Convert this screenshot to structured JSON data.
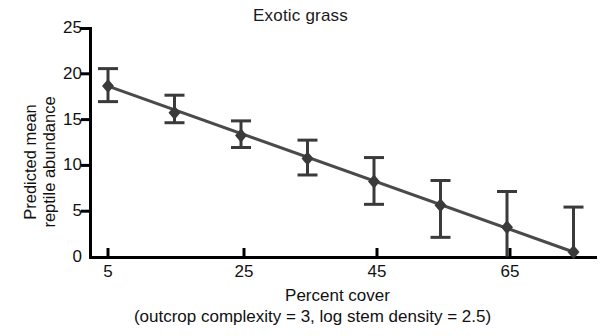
{
  "chart_data": {
    "type": "scatter",
    "title": "Exotic grass",
    "xlabel": "Percent cover",
    "xlabel_note": "(outcrop complexity = 3, log stem density = 2.5)",
    "ylabel": "Predicted mean\nreptile abundance",
    "xlim": [
      0,
      80
    ],
    "ylim": [
      0,
      25
    ],
    "xticks": [
      5,
      25,
      45,
      65
    ],
    "yticks": [
      0,
      5,
      10,
      15,
      20,
      25
    ],
    "xtick_labels": [
      "5",
      "25",
      "45",
      "65"
    ],
    "ytick_labels": [
      "0",
      "5",
      "10",
      "15",
      "20",
      "25"
    ],
    "grid": false,
    "legend": "none",
    "marker": "filled-diamond",
    "errorbars": true,
    "x": [
      5,
      15,
      25,
      35,
      45,
      55,
      65,
      75
    ],
    "y": [
      18.6,
      15.7,
      13.2,
      10.7,
      8.2,
      5.6,
      3.2,
      0.5
    ],
    "yerr_low": [
      1.7,
      1.1,
      1.3,
      1.8,
      2.5,
      3.5,
      3.2,
      0.5
    ],
    "yerr_high": [
      1.9,
      1.9,
      1.6,
      2.0,
      2.6,
      2.7,
      3.9,
      4.9
    ],
    "series": [
      {
        "name": "Predicted mean reptile abundance",
        "points": [
          {
            "x": 5,
            "y": 18.6,
            "lo": 16.9,
            "hi": 20.5
          },
          {
            "x": 15,
            "y": 15.7,
            "lo": 14.6,
            "hi": 17.6
          },
          {
            "x": 25,
            "y": 13.2,
            "lo": 11.9,
            "hi": 14.8
          },
          {
            "x": 35,
            "y": 10.7,
            "lo": 8.9,
            "hi": 12.7
          },
          {
            "x": 45,
            "y": 8.2,
            "lo": 5.7,
            "hi": 10.8
          },
          {
            "x": 55,
            "y": 5.6,
            "lo": 2.1,
            "hi": 8.3
          },
          {
            "x": 65,
            "y": 3.2,
            "lo": 0.0,
            "hi": 7.1
          },
          {
            "x": 75,
            "y": 0.5,
            "lo": 0.0,
            "hi": 5.4
          }
        ]
      }
    ],
    "trendline": {
      "x_start": 5,
      "y_start": 18.6,
      "x_end": 75,
      "y_end": 0.5
    }
  },
  "colors": {
    "axis": "#000000",
    "marker": "#3a3a3a",
    "line": "#4a4a4a",
    "background": "#ffffff"
  }
}
